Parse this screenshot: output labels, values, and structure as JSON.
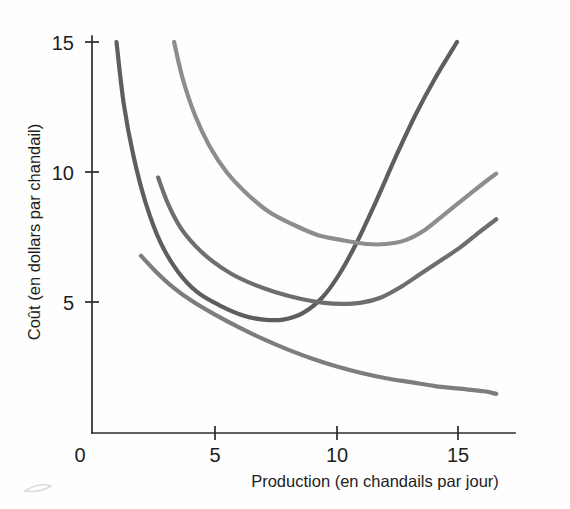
{
  "chart_data": {
    "type": "line",
    "title": "",
    "xlabel": "Production (en chandails par jour)",
    "ylabel": "Coût (en dollars par chandail)",
    "xlim": [
      0,
      17.3
    ],
    "ylim": [
      0,
      16.5
    ],
    "xticks": [
      0,
      5,
      10,
      15
    ],
    "xtick_labels": [
      "0",
      "5",
      "10",
      "15"
    ],
    "yticks": [
      0,
      5,
      10,
      15
    ],
    "ytick_labels": [
      "0",
      "5",
      "10",
      "15"
    ],
    "grid": false,
    "legend": "none",
    "series": [
      {
        "name": "marginal-cost",
        "label": "Coût marginal",
        "color": "#5e5e5e",
        "stroke_width": 4.2,
        "points": [
          [
            1.0,
            15.0
          ],
          [
            1.3,
            12.6
          ],
          [
            1.7,
            10.6
          ],
          [
            2.2,
            8.8
          ],
          [
            2.8,
            7.3
          ],
          [
            3.5,
            6.2
          ],
          [
            4.3,
            5.4
          ],
          [
            5.2,
            4.9
          ],
          [
            6.2,
            4.5
          ],
          [
            7.0,
            4.35
          ],
          [
            7.8,
            4.35
          ],
          [
            8.6,
            4.6
          ],
          [
            9.4,
            5.2
          ],
          [
            10.1,
            6.1
          ],
          [
            10.8,
            7.3
          ],
          [
            11.6,
            8.9
          ],
          [
            12.4,
            10.6
          ],
          [
            13.2,
            12.2
          ],
          [
            14.0,
            13.6
          ],
          [
            14.9,
            15.0
          ]
        ]
      },
      {
        "name": "average-total-cost",
        "label": "Coût total moyen",
        "color": "#8d8d8d",
        "stroke_width": 4.2,
        "points": [
          [
            3.35,
            15.0
          ],
          [
            3.7,
            13.6
          ],
          [
            4.2,
            12.2
          ],
          [
            4.8,
            11.0
          ],
          [
            5.5,
            10.0
          ],
          [
            6.3,
            9.2
          ],
          [
            7.2,
            8.5
          ],
          [
            8.2,
            8.0
          ],
          [
            9.2,
            7.6
          ],
          [
            10.2,
            7.4
          ],
          [
            11.2,
            7.25
          ],
          [
            12.0,
            7.25
          ],
          [
            12.8,
            7.4
          ],
          [
            13.6,
            7.8
          ],
          [
            14.4,
            8.4
          ],
          [
            15.2,
            9.0
          ],
          [
            16.0,
            9.6
          ],
          [
            16.5,
            9.95
          ]
        ]
      },
      {
        "name": "average-variable-cost",
        "label": "Coût variable moyen",
        "color": "#6e6e6e",
        "stroke_width": 4.2,
        "points": [
          [
            2.7,
            9.8
          ],
          [
            3.1,
            8.8
          ],
          [
            3.6,
            7.9
          ],
          [
            4.2,
            7.2
          ],
          [
            4.9,
            6.6
          ],
          [
            5.7,
            6.1
          ],
          [
            6.6,
            5.7
          ],
          [
            7.5,
            5.4
          ],
          [
            8.5,
            5.15
          ],
          [
            9.4,
            5.0
          ],
          [
            10.2,
            4.95
          ],
          [
            11.0,
            5.0
          ],
          [
            11.8,
            5.2
          ],
          [
            12.6,
            5.6
          ],
          [
            13.4,
            6.1
          ],
          [
            14.2,
            6.6
          ],
          [
            15.0,
            7.1
          ],
          [
            15.8,
            7.7
          ],
          [
            16.5,
            8.2
          ]
        ]
      },
      {
        "name": "average-fixed-cost",
        "label": "Coût fixe moyen",
        "color": "#7d7d7d",
        "stroke_width": 4.2,
        "points": [
          [
            2.0,
            6.8
          ],
          [
            2.6,
            6.2
          ],
          [
            3.3,
            5.6
          ],
          [
            4.1,
            5.05
          ],
          [
            5.0,
            4.55
          ],
          [
            6.0,
            4.05
          ],
          [
            7.0,
            3.6
          ],
          [
            8.0,
            3.2
          ],
          [
            9.0,
            2.85
          ],
          [
            10.0,
            2.55
          ],
          [
            11.0,
            2.3
          ],
          [
            12.0,
            2.1
          ],
          [
            13.0,
            1.95
          ],
          [
            14.0,
            1.8
          ],
          [
            15.0,
            1.7
          ],
          [
            16.0,
            1.6
          ],
          [
            16.5,
            1.5
          ]
        ]
      }
    ]
  },
  "axes": {
    "x_title": "Production (en chandails par jour)",
    "y_title": "Coût (en dollars par chandail)",
    "x_tick_labels": [
      "0",
      "5",
      "10",
      "15"
    ],
    "y_tick_labels": [
      "15",
      "10",
      "5"
    ],
    "origin_label": "0"
  },
  "colors": {
    "background": "#fefefe",
    "axis": "#2b2b2b",
    "text": "#1d1d1d",
    "curve_marginal": "#5e5e5e",
    "curve_total_average": "#8d8d8d",
    "curve_variable_average": "#6e6e6e",
    "curve_fixed_average": "#7d7d7d"
  }
}
